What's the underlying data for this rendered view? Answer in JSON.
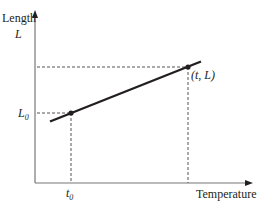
{
  "diagram": {
    "y_axis": {
      "label": "Length",
      "symbol": "L"
    },
    "x_axis": {
      "label": "Temperature",
      "symbol": "t"
    },
    "points": [
      {
        "label_main": "L",
        "label_sub": "0",
        "x_label_main": "t",
        "x_label_sub": "0",
        "name": "initial"
      },
      {
        "label": "(t, L)",
        "name": "final"
      }
    ],
    "colors": {
      "ink": "#231f20",
      "dashed": "#555555",
      "axis": "#777777"
    }
  }
}
